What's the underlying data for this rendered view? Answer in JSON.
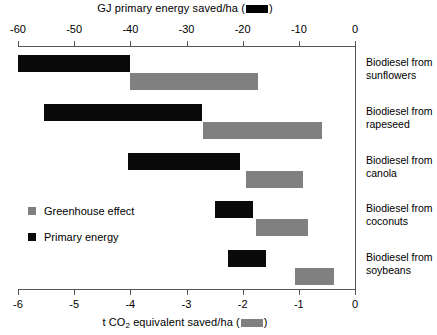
{
  "chart_data": {
    "type": "bar",
    "orientation": "horizontal",
    "title": "",
    "categories": [
      "Biodiesel from sunflowers",
      "Biodiesel from rapeseed",
      "Biodiesel from canola",
      "Biodiesel from coconuts",
      "Biodiesel from soybeans"
    ],
    "series": [
      {
        "name": "Primary energy",
        "axis": "top",
        "unit": "GJ primary energy saved/ha",
        "color": "#0a0a0a",
        "ranges": [
          [
            -60.0,
            -40.0
          ],
          [
            -55.3,
            -27.3
          ],
          [
            -40.4,
            -20.4
          ],
          [
            -25.0,
            -18.1
          ],
          [
            -22.7,
            -15.9
          ]
        ]
      },
      {
        "name": "Greenhouse effect",
        "axis": "bottom",
        "unit": "t CO2 equivalent saved/ha",
        "color": "#808080",
        "ranges": [
          [
            -4.0,
            -1.73
          ],
          [
            -2.71,
            -0.59
          ],
          [
            -1.94,
            -0.93
          ],
          [
            -1.77,
            -0.84
          ],
          [
            -1.07,
            -0.37
          ]
        ]
      }
    ],
    "top_axis": {
      "label_text": "GJ primary energy saved/ha (",
      "label_text_end": ")",
      "swatch": "black",
      "min": -60,
      "max": 0,
      "ticks": [
        -60,
        -50,
        -40,
        -30,
        -20,
        -10,
        0
      ],
      "tick_labels": [
        "-60",
        "-50",
        "-40",
        "-30",
        "-20",
        "-10",
        "0"
      ]
    },
    "bottom_axis": {
      "label_prefix": "t CO",
      "label_sub": "2",
      "label_suffix": " equivalent saved/ha (",
      "label_text_end": ")",
      "swatch": "gray",
      "min": -6,
      "max": 0,
      "ticks": [
        -6,
        -5,
        -4,
        -3,
        -2,
        -1,
        0
      ],
      "tick_labels": [
        "-6",
        "-5",
        "-4",
        "-3",
        "-2",
        "-1",
        "0"
      ]
    },
    "legend": {
      "position": "inside-left",
      "entries": [
        {
          "label": "Greenhouse effect",
          "color": "#808080"
        },
        {
          "label": "Primary energy",
          "color": "#0a0a0a"
        }
      ]
    },
    "grid": false
  },
  "colors": {
    "primary_energy": "#0a0a0a",
    "greenhouse_effect": "#808080",
    "axis": "#555555"
  }
}
